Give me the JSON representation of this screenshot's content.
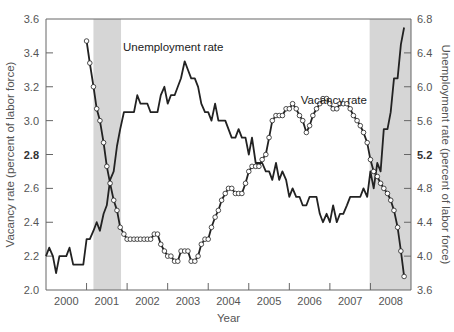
{
  "chart_data": {
    "type": "line",
    "title": "",
    "xlabel": "Year",
    "ylabel": "Vacancy rate (percent of labor force)",
    "y2label": "Unemployment rate (percent of labor force)",
    "xlim": [
      2000.0,
      2009.0
    ],
    "ylim": [
      2.0,
      3.6
    ],
    "y2lim": [
      3.6,
      6.8
    ],
    "x_tick_labels": [
      "2000",
      "2001",
      "2002",
      "2003",
      "2004",
      "2005",
      "2006",
      "2007",
      "2008"
    ],
    "x_tick_boundaries": [
      2001,
      2002,
      2003,
      2004,
      2005,
      2006,
      2007,
      2008
    ],
    "y_ticks": [
      "2.0",
      "2.2",
      "2.4",
      "2.6",
      "2.8",
      "3.0",
      "3.2",
      "3.4",
      "3.6"
    ],
    "y2_ticks": [
      "3.6",
      "4.0",
      "4.4",
      "4.8",
      "5.2",
      "5.6",
      "6.0",
      "6.4",
      "6.8"
    ],
    "bold_ticks": {
      "y": "2.8",
      "y2": "5.2"
    },
    "grid": false,
    "legend": "inline labels",
    "shaded_regions": [
      {
        "label": "recession",
        "start": 2001.17,
        "end": 2001.85
      },
      {
        "label": "recession",
        "start": 2007.98,
        "end": 2009.0
      }
    ],
    "series": [
      {
        "name": "Unemployment rate",
        "axis": "right",
        "marker": "none",
        "label_pos": {
          "x": 2001.9,
          "y2": 6.42
        },
        "x": [
          2000.0,
          2000.08,
          2000.17,
          2000.25,
          2000.33,
          2000.42,
          2000.5,
          2000.58,
          2000.67,
          2000.75,
          2000.83,
          2000.92,
          2001.0,
          2001.08,
          2001.17,
          2001.25,
          2001.33,
          2001.42,
          2001.5,
          2001.58,
          2001.67,
          2001.75,
          2001.83,
          2001.92,
          2002.0,
          2002.08,
          2002.17,
          2002.25,
          2002.33,
          2002.42,
          2002.5,
          2002.58,
          2002.67,
          2002.75,
          2002.83,
          2002.92,
          2003.0,
          2003.08,
          2003.17,
          2003.25,
          2003.33,
          2003.42,
          2003.5,
          2003.58,
          2003.67,
          2003.75,
          2003.83,
          2003.92,
          2004.0,
          2004.08,
          2004.17,
          2004.25,
          2004.33,
          2004.42,
          2004.5,
          2004.58,
          2004.67,
          2004.75,
          2004.83,
          2004.92,
          2005.0,
          2005.08,
          2005.17,
          2005.25,
          2005.33,
          2005.42,
          2005.5,
          2005.58,
          2005.67,
          2005.75,
          2005.83,
          2005.92,
          2006.0,
          2006.08,
          2006.17,
          2006.25,
          2006.33,
          2006.42,
          2006.5,
          2006.58,
          2006.67,
          2006.75,
          2006.83,
          2006.92,
          2007.0,
          2007.08,
          2007.17,
          2007.25,
          2007.33,
          2007.42,
          2007.5,
          2007.58,
          2007.67,
          2007.75,
          2007.83,
          2007.92,
          2008.0,
          2008.08,
          2008.17,
          2008.25,
          2008.33,
          2008.42,
          2008.5,
          2008.58,
          2008.67,
          2008.75,
          2008.83
        ],
        "values": [
          4.0,
          4.1,
          4.0,
          3.8,
          4.0,
          4.0,
          4.0,
          4.1,
          3.9,
          3.9,
          3.9,
          3.9,
          4.2,
          4.2,
          4.3,
          4.4,
          4.3,
          4.5,
          4.6,
          4.9,
          5.0,
          5.3,
          5.5,
          5.7,
          5.7,
          5.7,
          5.7,
          5.9,
          5.8,
          5.8,
          5.8,
          5.7,
          5.7,
          5.7,
          5.9,
          6.0,
          5.8,
          5.9,
          5.9,
          6.0,
          6.1,
          6.3,
          6.2,
          6.1,
          6.1,
          6.0,
          5.8,
          5.7,
          5.7,
          5.6,
          5.8,
          5.6,
          5.6,
          5.6,
          5.5,
          5.4,
          5.4,
          5.5,
          5.4,
          5.4,
          5.2,
          5.4,
          5.1,
          5.1,
          5.1,
          5.0,
          5.0,
          4.9,
          5.1,
          4.9,
          5.0,
          4.9,
          4.7,
          4.8,
          4.7,
          4.7,
          4.6,
          4.6,
          4.7,
          4.7,
          4.7,
          4.5,
          4.4,
          4.5,
          4.4,
          4.6,
          4.4,
          4.5,
          4.5,
          4.6,
          4.7,
          4.7,
          4.7,
          4.7,
          4.8,
          4.7,
          5.0,
          4.8,
          5.1,
          5.0,
          5.5,
          5.5,
          5.7,
          6.1,
          6.1,
          6.5,
          6.7
        ]
      },
      {
        "name": "Vacancy rate",
        "axis": "left",
        "marker": "circle",
        "label_pos": {
          "x": 2006.28,
          "y": 3.1
        },
        "x": [
          2001.0,
          2001.08,
          2001.17,
          2001.25,
          2001.33,
          2001.42,
          2001.5,
          2001.58,
          2001.67,
          2001.75,
          2001.83,
          2001.92,
          2002.0,
          2002.08,
          2002.17,
          2002.25,
          2002.33,
          2002.42,
          2002.5,
          2002.58,
          2002.67,
          2002.75,
          2002.83,
          2002.92,
          2003.0,
          2003.08,
          2003.17,
          2003.25,
          2003.33,
          2003.42,
          2003.5,
          2003.58,
          2003.67,
          2003.75,
          2003.83,
          2003.92,
          2004.0,
          2004.08,
          2004.17,
          2004.25,
          2004.33,
          2004.42,
          2004.5,
          2004.58,
          2004.67,
          2004.75,
          2004.83,
          2004.92,
          2005.0,
          2005.08,
          2005.17,
          2005.25,
          2005.33,
          2005.42,
          2005.5,
          2005.58,
          2005.67,
          2005.75,
          2005.83,
          2005.92,
          2006.0,
          2006.08,
          2006.17,
          2006.25,
          2006.33,
          2006.42,
          2006.5,
          2006.58,
          2006.67,
          2006.75,
          2006.83,
          2006.92,
          2007.0,
          2007.08,
          2007.17,
          2007.25,
          2007.33,
          2007.42,
          2007.5,
          2007.58,
          2007.67,
          2007.75,
          2007.83,
          2007.92,
          2008.0,
          2008.08,
          2008.17,
          2008.25,
          2008.33,
          2008.42,
          2008.5,
          2008.58,
          2008.67,
          2008.75,
          2008.83
        ],
        "values": [
          3.47,
          3.34,
          3.2,
          3.07,
          3.0,
          2.87,
          2.73,
          2.63,
          2.53,
          2.47,
          2.37,
          2.33,
          2.3,
          2.3,
          2.3,
          2.3,
          2.3,
          2.3,
          2.3,
          2.3,
          2.33,
          2.33,
          2.27,
          2.23,
          2.2,
          2.2,
          2.17,
          2.17,
          2.23,
          2.23,
          2.23,
          2.17,
          2.17,
          2.2,
          2.27,
          2.3,
          2.3,
          2.37,
          2.43,
          2.47,
          2.53,
          2.57,
          2.6,
          2.6,
          2.57,
          2.57,
          2.57,
          2.63,
          2.7,
          2.73,
          2.73,
          2.73,
          2.77,
          2.8,
          2.9,
          3.0,
          3.03,
          3.03,
          3.03,
          3.07,
          3.07,
          3.1,
          3.07,
          3.03,
          3.0,
          2.93,
          2.97,
          3.03,
          3.07,
          3.1,
          3.13,
          3.13,
          3.1,
          3.07,
          3.07,
          3.1,
          3.1,
          3.1,
          3.07,
          3.03,
          3.0,
          2.97,
          2.93,
          2.87,
          2.77,
          2.7,
          2.67,
          2.63,
          2.6,
          2.57,
          2.53,
          2.47,
          2.37,
          2.23,
          2.08
        ]
      }
    ]
  },
  "colors": {
    "background": "#ffffff",
    "line": "#222222",
    "marker_fill": "#ffffff",
    "shading": "#d6d6d6",
    "axis": "#666666",
    "tick_text": "#555555"
  },
  "geometry": {
    "plot_left": 46,
    "plot_right": 411,
    "plot_top": 19,
    "plot_bottom": 290
  }
}
